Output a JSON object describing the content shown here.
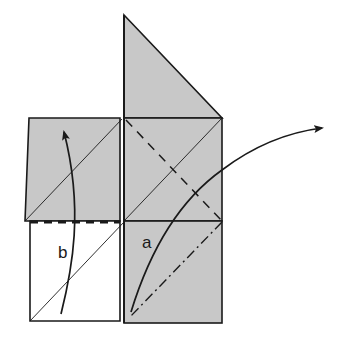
{
  "diagram": {
    "type": "origami-fold-instruction",
    "colors": {
      "paper_colored": "#c8c8c8",
      "paper_white": "#ffffff",
      "line": "#1a1a1a"
    },
    "labels": {
      "a": "a",
      "b": "b"
    },
    "elements": [
      {
        "id": "triangle-flap",
        "desc": "gray triangular flap on top of right column"
      },
      {
        "id": "left-square",
        "desc": "gray square, top-left"
      },
      {
        "id": "right-upper-square",
        "desc": "gray square, upper-right"
      },
      {
        "id": "right-lower-square",
        "desc": "gray square, lower-right, labeled a"
      },
      {
        "id": "left-lower-square",
        "desc": "white square, lower-left, labeled b"
      },
      {
        "id": "valley-fold-line",
        "desc": "dashed diagonal in upper-right square"
      },
      {
        "id": "mountain-fold-line",
        "desc": "dash-dot diagonal in lower-right square"
      },
      {
        "id": "horizontal-valley-fold",
        "desc": "bold dashed line along bottom of left gray square"
      },
      {
        "id": "arrow-a",
        "desc": "curved arrow from bottom of a up and to the right"
      },
      {
        "id": "arrow-b",
        "desc": "curved arrow from bottom of b upward"
      }
    ]
  }
}
